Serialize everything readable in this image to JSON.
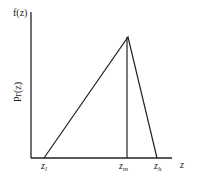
{
  "diagram": {
    "type": "triangular distribution",
    "y_axis_top_label": "f(z)",
    "y_axis_side_label": "Pr(z)",
    "x_axis_label": "z",
    "ticks": [
      {
        "base": "z",
        "sub": "l"
      },
      {
        "base": "z",
        "sub": "m"
      },
      {
        "base": "z",
        "sub": "h"
      }
    ],
    "line_color": "#222222"
  }
}
